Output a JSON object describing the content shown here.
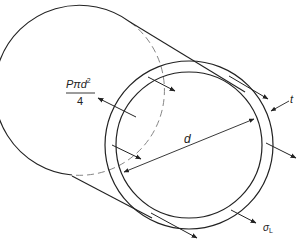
{
  "diagram": {
    "labels": {
      "force_numerator": "Pπd",
      "force_exponent": "2",
      "force_denominator": "4",
      "diameter": "d",
      "thickness": "t",
      "stress_symbol": "σ",
      "stress_subscript": "L"
    },
    "colors": {
      "line": "#222222",
      "background": "#ffffff"
    }
  }
}
